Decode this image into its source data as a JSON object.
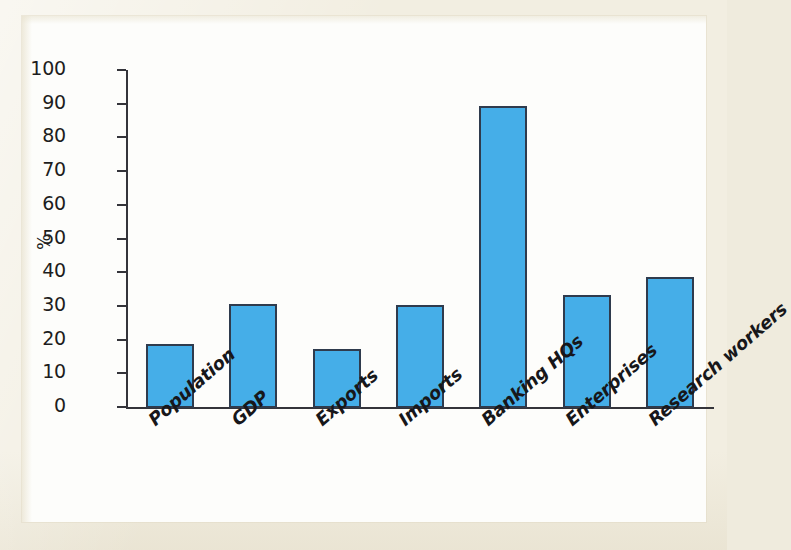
{
  "chart_data": {
    "type": "bar",
    "title": "",
    "subtitle": "",
    "xlabel": "",
    "ylabel": "%",
    "ylim": [
      0,
      100
    ],
    "ytick_step": 10,
    "yticks": [
      100,
      90,
      80,
      70,
      60,
      50,
      40,
      30,
      20,
      10,
      0
    ],
    "grid": false,
    "legend": false,
    "legend_position": "none",
    "categories": [
      "Population",
      "GDP",
      "Exports",
      "Imports",
      "Banking HQs",
      "Enterprises",
      "Research workers"
    ],
    "values": [
      19,
      31,
      17.5,
      30.7,
      89.5,
      33.5,
      39
    ],
    "bar_color": "#45aee8",
    "bar_outline_color": "#2f3b4d",
    "label_rotation_degrees": -41
  },
  "figure": {
    "background_color": "#fdfdfb",
    "page_color": "#f2eee1"
  }
}
